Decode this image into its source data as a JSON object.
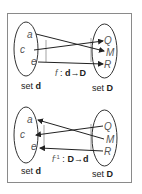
{
  "figure": {
    "diagrams": [
      {
        "name": "function-f",
        "domain_set": {
          "label_prefix": "set ",
          "label_name": "d",
          "elements": [
            "a",
            "c",
            "e"
          ]
        },
        "codomain_set": {
          "label_prefix": "set ",
          "label_name": "D",
          "elements": [
            "Q",
            "M",
            "R"
          ]
        },
        "function_label": {
          "name": "f",
          "separator": " : ",
          "from": "d",
          "arrow": "→",
          "to": "D"
        },
        "mappings": [
          {
            "from": "a",
            "to": "M"
          },
          {
            "from": "c",
            "to": "Q"
          },
          {
            "from": "e",
            "to": "R"
          }
        ]
      },
      {
        "name": "function-f-inverse",
        "domain_set": {
          "label_prefix": "set ",
          "label_name": "d",
          "elements": [
            "a",
            "c",
            "e"
          ]
        },
        "codomain_set": {
          "label_prefix": "set ",
          "label_name": "D",
          "elements": [
            "Q",
            "M",
            "R"
          ]
        },
        "function_label": {
          "name": "f",
          "superscript": "-1",
          "separator": " : ",
          "from": "D",
          "arrow": "→",
          "to": "d"
        },
        "mappings": [
          {
            "from": "M",
            "to": "a"
          },
          {
            "from": "Q",
            "to": "c"
          },
          {
            "from": "R",
            "to": "e"
          }
        ]
      }
    ]
  },
  "colors": {
    "stroke": "#333333",
    "element_label": "#555555",
    "frame": "#8a8a8a"
  }
}
